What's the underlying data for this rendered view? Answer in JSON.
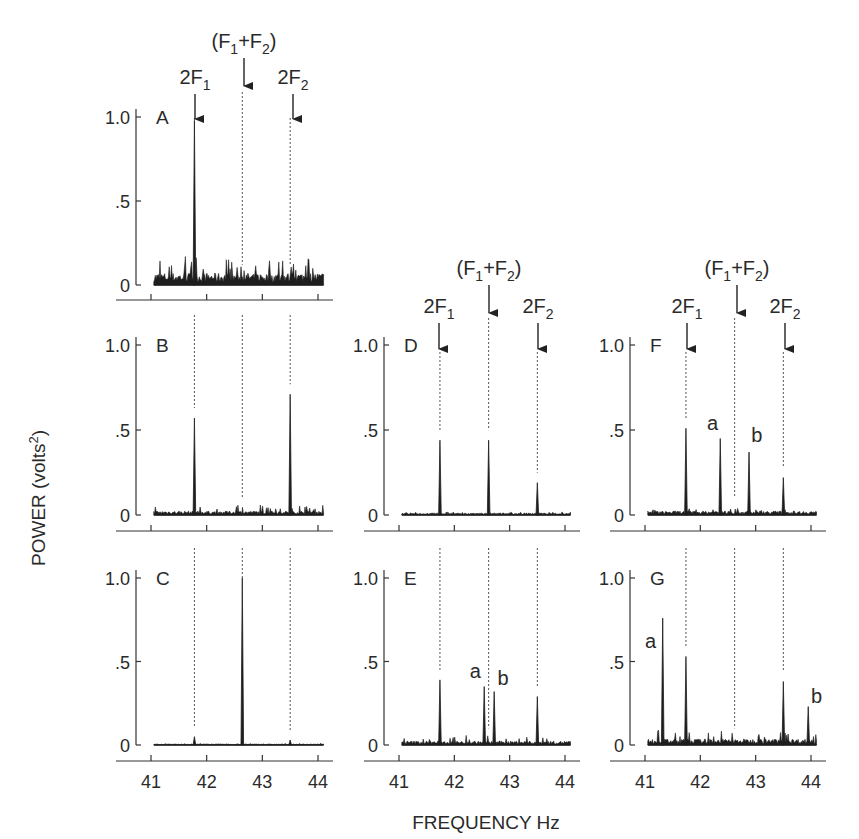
{
  "figure": {
    "ylabel": "POWER (volts",
    "ylabel_sup": "2",
    "ylabel_close": ")",
    "xlabel": "FREQUENCY Hz",
    "xtick_labels": [
      "41",
      "42",
      "43",
      "44"
    ],
    "ytick_labels": [
      "0",
      ".5",
      "1.0"
    ],
    "marker_labels": {
      "twoF1": "2F",
      "twoF1_sub": "1",
      "sum_open": "(F",
      "sum_sub1": "1",
      "sum_plus": "+F",
      "sum_sub2": "2",
      "sum_close": ")",
      "twoF2": "2F",
      "twoF2_sub": "2"
    },
    "colors": {
      "trace": "#1e1e1e",
      "axis": "#333333",
      "guide": "#555555",
      "background": "#ffffff"
    }
  },
  "chart_data": [
    {
      "panel": "A",
      "type": "line",
      "title": "A",
      "xlabel": "FREQUENCY Hz",
      "ylabel": "POWER (volts2)",
      "xlim": [
        41,
        44.1
      ],
      "ylim": [
        0,
        1.0
      ],
      "peaks": [
        {
          "label": "2F1",
          "x": 41.78,
          "y": 0.98
        }
      ],
      "noise_floor": 0.06,
      "noise_max": 0.17,
      "markers": {
        "2F1": 41.78,
        "F1+F2": 42.64,
        "2F2": 43.5
      }
    },
    {
      "panel": "B",
      "type": "line",
      "title": "B",
      "xlim": [
        41,
        44.1
      ],
      "ylim": [
        0,
        1.0
      ],
      "peaks": [
        {
          "label": "2F1",
          "x": 41.78,
          "y": 0.57
        },
        {
          "label": "2F2",
          "x": 43.5,
          "y": 0.71
        }
      ],
      "noise_floor": 0.02,
      "noise_max": 0.06,
      "markers": {
        "2F1": 41.78,
        "F1+F2": 42.64,
        "2F2": 43.5
      }
    },
    {
      "panel": "C",
      "type": "line",
      "title": "C",
      "xlim": [
        41,
        44.1
      ],
      "ylim": [
        0,
        1.0
      ],
      "peaks": [
        {
          "label": "F1+F2",
          "x": 42.64,
          "y": 1.0
        },
        {
          "label": "2F1",
          "x": 41.78,
          "y": 0.05
        },
        {
          "label": "2F2",
          "x": 43.5,
          "y": 0.03
        }
      ],
      "noise_floor": 0.005,
      "noise_max": 0.01,
      "markers": {
        "2F1": 41.78,
        "F1+F2": 42.64,
        "2F2": 43.5
      }
    },
    {
      "panel": "D",
      "type": "line",
      "title": "D",
      "xlim": [
        41,
        44.1
      ],
      "ylim": [
        0,
        1.0
      ],
      "peaks": [
        {
          "label": "2F1",
          "x": 41.74,
          "y": 0.44
        },
        {
          "label": "F1+F2",
          "x": 42.62,
          "y": 0.44
        },
        {
          "label": "2F2",
          "x": 43.5,
          "y": 0.19
        }
      ],
      "noise_floor": 0.01,
      "noise_max": 0.02,
      "markers": {
        "2F1": 41.74,
        "F1+F2": 42.62,
        "2F2": 43.5
      }
    },
    {
      "panel": "E",
      "type": "line",
      "title": "E",
      "xlim": [
        41,
        44.1
      ],
      "ylim": [
        0,
        1.0
      ],
      "peaks": [
        {
          "label": "2F1",
          "x": 41.74,
          "y": 0.39
        },
        {
          "label": "a",
          "x": 42.54,
          "y": 0.35
        },
        {
          "label": "b",
          "x": 42.72,
          "y": 0.32
        },
        {
          "label": "2F2",
          "x": 43.5,
          "y": 0.29
        }
      ],
      "noise_floor": 0.02,
      "noise_max": 0.06,
      "annotations": [
        "a",
        "b"
      ],
      "markers": {
        "2F1": 41.74,
        "F1+F2": 42.62,
        "2F2": 43.5
      }
    },
    {
      "panel": "F",
      "type": "line",
      "title": "F",
      "xlim": [
        41,
        44.1
      ],
      "ylim": [
        0,
        1.0
      ],
      "peaks": [
        {
          "label": "2F1",
          "x": 41.74,
          "y": 0.51
        },
        {
          "label": "a",
          "x": 42.36,
          "y": 0.45
        },
        {
          "label": "b",
          "x": 42.88,
          "y": 0.37
        },
        {
          "label": "2F2",
          "x": 43.5,
          "y": 0.22
        }
      ],
      "noise_floor": 0.02,
      "noise_max": 0.04,
      "annotations": [
        "a",
        "b"
      ],
      "markers": {
        "2F1": 41.74,
        "F1+F2": 42.62,
        "2F2": 43.5
      }
    },
    {
      "panel": "G",
      "type": "line",
      "title": "G",
      "xlim": [
        41,
        44.1
      ],
      "ylim": [
        0,
        1.0
      ],
      "peaks": [
        {
          "label": "a",
          "x": 41.32,
          "y": 0.76
        },
        {
          "label": "2F1",
          "x": 41.74,
          "y": 0.53
        },
        {
          "label": "2F2",
          "x": 43.5,
          "y": 0.38
        },
        {
          "label": "b",
          "x": 43.95,
          "y": 0.23
        }
      ],
      "noise_floor": 0.03,
      "noise_max": 0.09,
      "annotations": [
        "a",
        "b"
      ],
      "markers": {
        "2F1": 41.74,
        "F1+F2": 42.62,
        "2F2": 43.5
      }
    }
  ]
}
